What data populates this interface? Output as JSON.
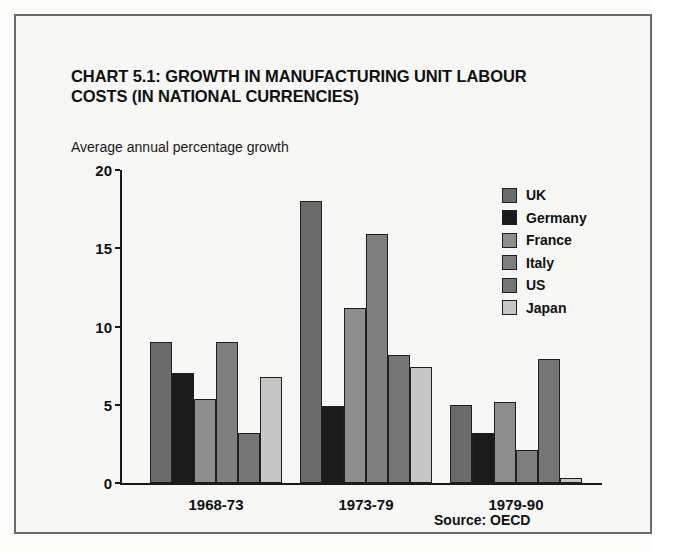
{
  "figure": {
    "title": "CHART 5.1: GROWTH IN MANUFACTURING UNIT LABOUR COSTS (IN NATIONAL CURRENCIES)",
    "subtitle": "Average annual percentage growth",
    "source": "Source: OECD"
  },
  "chart_data": {
    "type": "bar",
    "title": "CHART 5.1: GROWTH IN MANUFACTURING UNIT LABOUR COSTS (IN NATIONAL CURRENCIES)",
    "subtitle": "Average annual percentage growth",
    "xlabel": "",
    "ylabel": "Average annual percentage growth",
    "ylim": [
      0,
      20
    ],
    "yticks": [
      0,
      5,
      10,
      15,
      20
    ],
    "grid": false,
    "legend_position": "top-right",
    "categories": [
      "1968-73",
      "1973-79",
      "1979-90"
    ],
    "series": [
      {
        "name": "UK",
        "color": "#6b6b6b",
        "values": [
          9.0,
          18.0,
          5.0
        ]
      },
      {
        "name": "Germany",
        "color": "#1a1a1a",
        "values": [
          7.0,
          4.9,
          3.2
        ]
      },
      {
        "name": "France",
        "color": "#8d8d8d",
        "values": [
          5.4,
          11.2,
          5.2
        ]
      },
      {
        "name": "Italy",
        "color": "#7f7f7f",
        "values": [
          9.0,
          15.9,
          2.1
        ]
      },
      {
        "name": "US",
        "color": "#757575",
        "values": [
          3.2,
          8.2,
          7.9
        ]
      },
      {
        "name": "Japan",
        "color": "#c6c6c6",
        "values": [
          6.8,
          7.4,
          0.3
        ]
      }
    ]
  }
}
